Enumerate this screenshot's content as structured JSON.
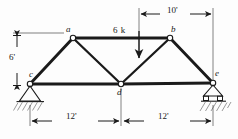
{
  "figure": {
    "type": "truss-free-body-diagram",
    "background_color": "#fdfdfd",
    "line_color": "#1a1a1a",
    "hatch_color": "#8a8a8a"
  },
  "nodes": [
    {
      "id": "a",
      "label": "a",
      "x": 73,
      "y": 38,
      "label_x": 66,
      "label_y": 26
    },
    {
      "id": "b",
      "label": "b",
      "x": 170,
      "y": 38,
      "label_x": 171,
      "label_y": 26
    },
    {
      "id": "c",
      "label": "c",
      "x": 30,
      "y": 84,
      "label_x": 30,
      "label_y": 71
    },
    {
      "id": "d",
      "label": "d",
      "x": 121,
      "y": 84,
      "label_x": 117,
      "label_y": 89
    },
    {
      "id": "e",
      "label": "e",
      "x": 213,
      "y": 83,
      "label_x": 214,
      "label_y": 70
    }
  ],
  "members": [
    {
      "from": "c",
      "to": "a"
    },
    {
      "from": "a",
      "to": "b"
    },
    {
      "from": "b",
      "to": "e"
    },
    {
      "from": "c",
      "to": "d"
    },
    {
      "from": "d",
      "to": "e"
    },
    {
      "from": "a",
      "to": "d"
    },
    {
      "from": "d",
      "to": "b"
    }
  ],
  "supports": [
    {
      "at": "c",
      "kind": "pin",
      "name": "pin-support"
    },
    {
      "at": "e",
      "kind": "roller",
      "name": "roller-support"
    }
  ],
  "load": {
    "label": "6 k",
    "magnitude": 6,
    "unit": "k",
    "direction": "down",
    "x": 139,
    "y_start": 31,
    "y_end": 63,
    "label_x": 114,
    "label_y": 27
  },
  "dimensions": [
    {
      "id": "height",
      "label": "6'",
      "orientation": "vertical",
      "value": 6,
      "unit": "ft",
      "x": 17,
      "y_start": 38,
      "y_end": 84,
      "label_x": 10,
      "label_y": 56
    },
    {
      "id": "top-right-span",
      "label": "10'",
      "orientation": "horizontal",
      "value": 10,
      "unit": "ft",
      "y": 14,
      "x_start": 139,
      "x_end": 213,
      "label_x": 168,
      "label_y": 6
    },
    {
      "id": "left-span",
      "label": "12'",
      "orientation": "horizontal",
      "value": 12,
      "unit": "ft",
      "y": 121,
      "x_start": 30,
      "x_end": 121,
      "label_x": 68,
      "label_y": 113
    },
    {
      "id": "right-span",
      "label": "12'",
      "orientation": "horizontal",
      "value": 12,
      "unit": "ft",
      "y": 121,
      "x_start": 121,
      "x_end": 213,
      "label_x": 160,
      "label_y": 113
    }
  ]
}
